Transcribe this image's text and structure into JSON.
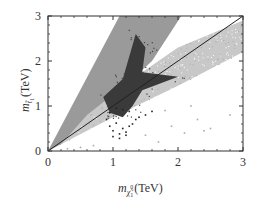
{
  "chart_data": {
    "type": "scatter",
    "title": "",
    "xlabel": "m_{χ̃1^0} (TeV)",
    "ylabel": "m_{t̃1} (TeV)",
    "xlabel_main": "m",
    "xlabel_sub": "χ̃",
    "xlabel_subsub": "1",
    "xlabel_sup": "0",
    "xlabel_unit": "(TeV)",
    "ylabel_main": "m",
    "ylabel_sub": "t̃",
    "ylabel_subsub": "1",
    "ylabel_unit": "(TeV)",
    "xlim": [
      0,
      3
    ],
    "ylim": [
      0,
      3
    ],
    "x_ticks": [
      "0",
      "1",
      "2",
      "3"
    ],
    "y_ticks": [
      "0",
      "1",
      "2",
      "3"
    ],
    "grid": false,
    "legend": null,
    "series": [
      {
        "name": "mid-gray allowed region (wedge above diagonal)",
        "kind": "area",
        "color": "#9a9a9a",
        "polygon": [
          [
            0,
            0
          ],
          [
            1.1,
            3.0
          ],
          [
            2.05,
            3.0
          ],
          [
            1.6,
            2.0
          ],
          [
            1.0,
            1.2
          ],
          [
            0.55,
            0.6
          ],
          [
            0.2,
            0.15
          ]
        ]
      },
      {
        "name": "light speckled band (below diagonal)",
        "kind": "scatter-band",
        "color": "#c8c8c8",
        "polygon": [
          [
            0.2,
            0.15
          ],
          [
            1.0,
            0.75
          ],
          [
            2.0,
            1.45
          ],
          [
            3.0,
            2.2
          ],
          [
            3.0,
            2.9
          ],
          [
            2.0,
            2.3
          ],
          [
            1.3,
            1.6
          ],
          [
            0.6,
            0.8
          ]
        ]
      },
      {
        "name": "dark region",
        "kind": "area",
        "color": "#3a3a3a",
        "polygon": [
          [
            0.85,
            1.2
          ],
          [
            1.15,
            1.6
          ],
          [
            1.35,
            2.6
          ],
          [
            1.5,
            2.3
          ],
          [
            1.45,
            1.75
          ],
          [
            2.0,
            1.65
          ],
          [
            1.45,
            1.35
          ],
          [
            1.3,
            1.0
          ],
          [
            1.15,
            0.75
          ],
          [
            0.95,
            0.85
          ]
        ]
      },
      {
        "name": "sparse black points",
        "kind": "scatter",
        "color": "#222222",
        "x": [
          0.9,
          0.95,
          1.0,
          1.05,
          1.1,
          1.15,
          1.2,
          1.25,
          1.3,
          1.0,
          1.1,
          1.2,
          0.95,
          1.35,
          1.4,
          1.5,
          1.6,
          1.05,
          1.15,
          1.25
        ],
        "y": [
          0.7,
          0.55,
          0.45,
          0.62,
          0.38,
          0.5,
          0.42,
          0.55,
          0.6,
          0.32,
          0.28,
          0.35,
          0.85,
          0.7,
          0.75,
          0.8,
          0.88,
          0.95,
          0.92,
          0.88
        ]
      },
      {
        "name": "sparse gray points",
        "kind": "scatter",
        "color": "#aaaaaa",
        "x": [
          0.3,
          0.5,
          0.7,
          1.5,
          1.7,
          1.9,
          2.1,
          2.3,
          2.5,
          2.8,
          1.8,
          2.2,
          2.4
        ],
        "y": [
          0.05,
          0.08,
          0.12,
          0.35,
          0.2,
          0.55,
          0.4,
          0.7,
          0.5,
          0.8,
          0.9,
          1.0,
          0.45
        ]
      },
      {
        "name": "diagonal m_stop = m_neutralino",
        "kind": "line",
        "color": "#222222",
        "x": [
          0,
          3
        ],
        "y": [
          0,
          3
        ]
      }
    ]
  }
}
